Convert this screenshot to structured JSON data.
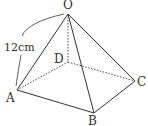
{
  "figure": {
    "type": "square pyramid",
    "vertices": {
      "O": {
        "label": "O",
        "x": 68,
        "y": 14,
        "lx": 68,
        "ly": 8
      },
      "A": {
        "label": "A",
        "x": 17,
        "y": 90,
        "lx": 11,
        "ly": 101
      },
      "B": {
        "label": "B",
        "x": 94,
        "y": 113,
        "lx": 93,
        "ly": 125
      },
      "C": {
        "label": "C",
        "x": 135,
        "y": 81,
        "lx": 142,
        "ly": 85
      },
      "D": {
        "label": "D",
        "x": 68,
        "y": 62,
        "lx": 58,
        "ly": 62
      }
    },
    "solid_edges": [
      "OA",
      "OB",
      "OC",
      "AB",
      "BC"
    ],
    "hidden_edges": [
      "OD",
      "AD",
      "DC"
    ],
    "measurement": {
      "label": "12cm",
      "edge": "OA"
    },
    "colors": {
      "stroke": "#333333",
      "background": "#ffffff"
    }
  }
}
